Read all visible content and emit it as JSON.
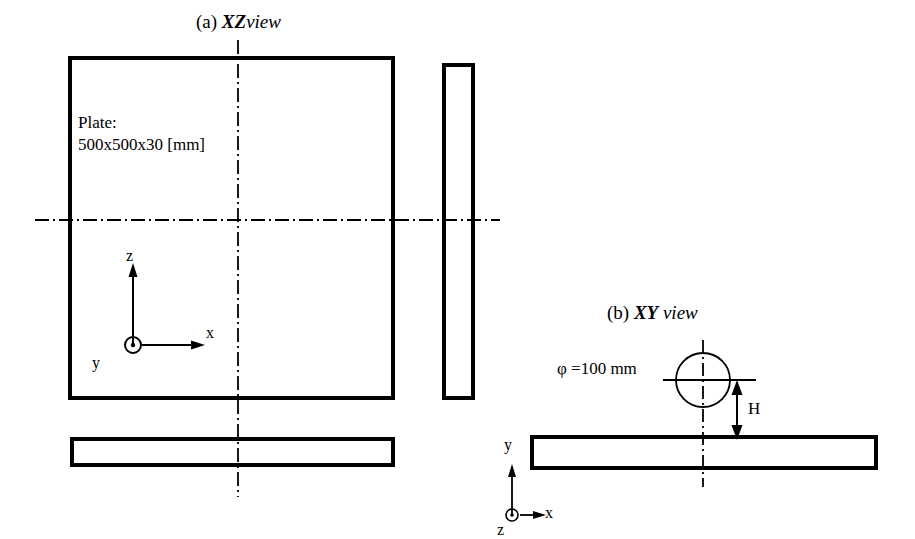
{
  "figure": {
    "background_color": "#ffffff",
    "line_color": "#000000",
    "views": [
      {
        "id": "xz",
        "tag": "(a)",
        "name_bold": "XZ",
        "name_italic": "view",
        "title_full": "(a) XZview"
      },
      {
        "id": "xy",
        "tag": "(b)",
        "name_bold": "XY",
        "name_italic": "view",
        "title_full": "(b) XY view"
      }
    ]
  },
  "labels": {
    "plate_caption_line1": "Plate:",
    "plate_caption_line2": "500x500x30 [mm]",
    "diameter": "φ =100 mm",
    "height_dimension": "H"
  },
  "axes": {
    "xz_view": {
      "vertical": "z",
      "horizontal": "x",
      "out_of_page": "y"
    },
    "xy_view": {
      "vertical": "y",
      "horizontal": "x",
      "out_of_page": "z"
    }
  },
  "geometry": {
    "plate": {
      "width_mm": 500,
      "depth_mm": 500,
      "thickness_mm": 30
    },
    "projectile": {
      "diameter_mm": 100,
      "standoff_symbol": "H"
    }
  }
}
